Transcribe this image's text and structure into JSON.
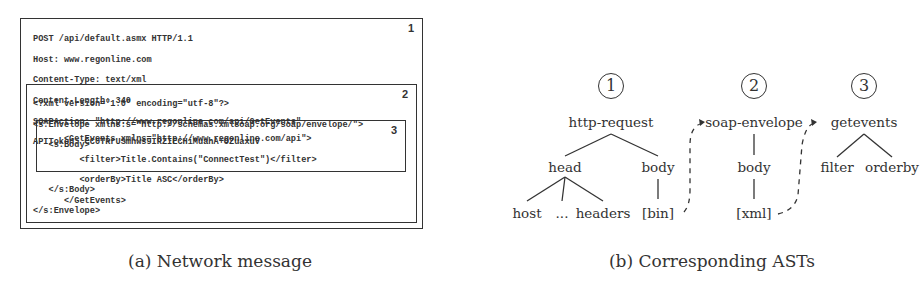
{
  "panel_a": {
    "caption": "(a) Network message",
    "box1": {
      "number": "1",
      "lines": [
        "POST /api/default.asmx HTTP/1.1",
        "Host: www.regonline.com",
        "Content-Type: text/xml",
        "Content-Length: 340",
        "SOAPAction: \"http://www.regonline.com/api/GetEvents\"",
        "APIToken: CC0TRrUSmhws9IRZIECHiMuahA+OZuaxuV"
      ]
    },
    "box2": {
      "number": "2",
      "lines_before": [
        "<?xml version=\"1.0\" encoding=\"utf-8\"?>",
        "<s:Envelope xmlns:s=\"http://schemas.xmlsoap.org/soap/envelope/\">",
        "   <s:Body>"
      ],
      "lines_after": [
        "   </s:Body>",
        "</s:Envelope>"
      ]
    },
    "box3": {
      "number": "3",
      "lines": [
        "      <GetEvents xmlns=\"http://www.regonline.com/api\">",
        "         <filter>Title.Contains(\"ConnectTest\")</filter>",
        "         <orderBy>Title ASC</orderBy>",
        "      </GetEvents>"
      ]
    }
  },
  "panel_b": {
    "caption": "(b) Corresponding ASTs",
    "trees": [
      {
        "marker": "1",
        "root": "http-request",
        "nodes": {
          "head": "head",
          "body": "body",
          "host": "host",
          "ellipsis": "...",
          "headers": "headers",
          "bin": "[bin]"
        }
      },
      {
        "marker": "2",
        "root": "soap-envelope",
        "nodes": {
          "body": "body",
          "xml": "[xml]"
        }
      },
      {
        "marker": "3",
        "root": "getevents",
        "nodes": {
          "filter": "filter",
          "orderby": "orderby"
        }
      }
    ],
    "links": [
      {
        "from": "[bin]",
        "to": "soap-envelope",
        "style": "dashed-arrow"
      },
      {
        "from": "[xml]",
        "to": "getevents",
        "style": "dashed-arrow"
      }
    ]
  }
}
